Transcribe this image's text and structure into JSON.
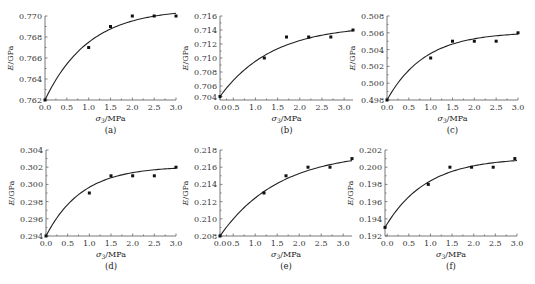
{
  "chart_data": [
    {
      "id": "a",
      "type": "scatter",
      "panel_label": "(a)",
      "xlabel": "σ3/MPa",
      "ylabel": "E/GPa",
      "xlim": [
        0,
        3.0
      ],
      "ylim": [
        0.762,
        0.77
      ],
      "xticks": [
        "0.0",
        "0.5",
        "1.0",
        "1.5",
        "2.0",
        "2.5",
        "3.0"
      ],
      "xtick_values": [
        0,
        0.5,
        1.0,
        1.5,
        2.0,
        2.5,
        3.0
      ],
      "yticks": [
        "0.762",
        "0.764",
        "0.766",
        "0.768",
        "0.770"
      ],
      "ytick_values": [
        0.762,
        0.764,
        0.766,
        0.768,
        0.77
      ],
      "points": {
        "x": [
          0,
          1.0,
          1.5,
          2.0,
          2.5,
          3.0
        ],
        "y": [
          0.762,
          0.767,
          0.769,
          0.77,
          0.77,
          0.77
        ]
      },
      "fit": {
        "type": "exponential-saturation",
        "y0": 0.762,
        "ymax": 0.7707,
        "k": 1.0
      },
      "box": {
        "x0": 45,
        "x1": 176,
        "y0": 16,
        "y1": 100
      }
    },
    {
      "id": "b",
      "type": "scatter",
      "panel_label": "(b)",
      "xlabel": "σ3/MPa",
      "ylabel": "E/GPa",
      "xlim": [
        0.2,
        3.2
      ],
      "ylim": [
        0.704,
        0.716
      ],
      "xticks": [
        "0.0",
        "0.5",
        "1.0",
        "1.5",
        "2.0",
        "2.5",
        "3.0"
      ],
      "xtick_values": [
        0.2,
        0.5,
        1.0,
        1.5,
        2.0,
        2.5,
        3.0
      ],
      "yticks": [
        "0.704",
        "0.706",
        "0.708",
        "0.710",
        "0.712",
        "0.714",
        "0.716"
      ],
      "ytick_values": [
        0.7045,
        0.706,
        0.708,
        0.71,
        0.712,
        0.714,
        0.716
      ],
      "points": {
        "x": [
          0.2,
          1.2,
          1.7,
          2.2,
          2.7,
          3.2
        ],
        "y": [
          0.7045,
          0.71,
          0.713,
          0.713,
          0.713,
          0.714
        ]
      },
      "fit": {
        "type": "exponential-saturation",
        "y0": 0.7045,
        "ymax": 0.7147,
        "k": 0.85,
        "xstart": 0.2
      },
      "box": {
        "x0": 220,
        "x1": 353,
        "y0": 16,
        "y1": 100
      }
    },
    {
      "id": "c",
      "type": "scatter",
      "panel_label": "(c)",
      "xlabel": "σ3/MPa",
      "ylabel": "E/GPa",
      "xlim": [
        0,
        3.0
      ],
      "ylim": [
        0.498,
        0.508
      ],
      "xticks": [
        "0.0",
        "0.5",
        "1.0",
        "1.5",
        "2.0",
        "2.5",
        "3.0"
      ],
      "xtick_values": [
        0,
        0.5,
        1.0,
        1.5,
        2.0,
        2.5,
        3.0
      ],
      "yticks": [
        "0.498",
        "0.500",
        "0.502",
        "0.504",
        "0.506",
        "0.508"
      ],
      "ytick_values": [
        0.498,
        0.5,
        0.502,
        0.504,
        0.506,
        0.508
      ],
      "points": {
        "x": [
          0,
          1.0,
          1.5,
          2.0,
          2.5,
          3.0
        ],
        "y": [
          0.498,
          0.503,
          0.505,
          0.505,
          0.505,
          0.506
        ]
      },
      "fit": {
        "type": "exponential-saturation",
        "y0": 0.498,
        "ymax": 0.5061,
        "k": 1.15
      },
      "box": {
        "x0": 387,
        "x1": 518,
        "y0": 16,
        "y1": 100
      }
    },
    {
      "id": "d",
      "type": "scatter",
      "panel_label": "(d)",
      "xlabel": "σ3/MPa",
      "ylabel": "E/GPa",
      "xlim": [
        0,
        3.0
      ],
      "ylim": [
        0.294,
        0.304
      ],
      "xticks": [
        "0.0",
        "0.5",
        "1.0",
        "1.5",
        "2.0",
        "2.5",
        "3.0"
      ],
      "xtick_values": [
        0,
        0.5,
        1.0,
        1.5,
        2.0,
        2.5,
        3.0
      ],
      "yticks": [
        "0.294",
        "0.296",
        "0.298",
        "0.300",
        "0.302",
        "0.304"
      ],
      "ytick_values": [
        0.294,
        0.296,
        0.298,
        0.3,
        0.302,
        0.304
      ],
      "points": {
        "x": [
          0,
          1.0,
          1.5,
          2.0,
          2.5,
          3.0
        ],
        "y": [
          0.294,
          0.299,
          0.301,
          0.301,
          0.301,
          0.302
        ]
      },
      "fit": {
        "type": "exponential-saturation",
        "y0": 0.294,
        "ymax": 0.3021,
        "k": 1.2
      },
      "box": {
        "x0": 46,
        "x1": 176,
        "y0": 150,
        "y1": 236
      }
    },
    {
      "id": "e",
      "type": "scatter",
      "panel_label": "(e)",
      "xlabel": "σ3/MPa",
      "ylabel": "E/GPa",
      "xlim": [
        0.2,
        3.2
      ],
      "ylim": [
        0.208,
        0.218
      ],
      "xticks": [
        "0.0",
        "0.5",
        "1.0",
        "1.5",
        "2.0",
        "2.5",
        "3.0"
      ],
      "xtick_values": [
        0.2,
        0.5,
        1.0,
        1.5,
        2.0,
        2.5,
        3.0
      ],
      "yticks": [
        "0.208",
        "0.210",
        "0.212",
        "0.214",
        "0.216",
        "0.218"
      ],
      "ytick_values": [
        0.208,
        0.21,
        0.212,
        0.214,
        0.216,
        0.218
      ],
      "points": {
        "x": [
          0.2,
          1.2,
          1.7,
          2.2,
          2.7,
          3.2
        ],
        "y": [
          0.208,
          0.213,
          0.215,
          0.216,
          0.216,
          0.217
        ]
      },
      "fit": {
        "type": "exponential-saturation",
        "y0": 0.208,
        "ymax": 0.2178,
        "k": 0.75,
        "xstart": 0.2
      },
      "box": {
        "x0": 220,
        "x1": 352,
        "y0": 150,
        "y1": 236
      }
    },
    {
      "id": "f",
      "type": "scatter",
      "panel_label": "(f)",
      "xlabel": "σ3/MPa",
      "ylabel": "E/GPa",
      "xlim": [
        -0.05,
        3.0
      ],
      "ylim": [
        0.192,
        0.202
      ],
      "xticks": [
        "0.0",
        "0.5",
        "1.0",
        "1.5",
        "2.0",
        "2.5",
        "3.0"
      ],
      "xtick_values": [
        0,
        0.5,
        1.0,
        1.5,
        2.0,
        2.5,
        3.0
      ],
      "yticks": [
        "0.192",
        "0.194",
        "0.196",
        "0.198",
        "0.200",
        "0.202"
      ],
      "ytick_values": [
        0.192,
        0.194,
        0.196,
        0.198,
        0.2,
        0.202
      ],
      "points": {
        "x": [
          -0.05,
          0.95,
          1.45,
          1.95,
          2.45,
          2.95
        ],
        "y": [
          0.193,
          0.198,
          0.2,
          0.2,
          0.2,
          0.201
        ]
      },
      "fit": {
        "type": "exponential-saturation",
        "y0": 0.193,
        "ymax": 0.2011,
        "k": 1.05,
        "xstart": -0.05
      },
      "box": {
        "x0": 385,
        "x1": 517,
        "y0": 150,
        "y1": 236
      }
    }
  ]
}
